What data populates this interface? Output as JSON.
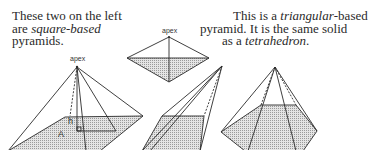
{
  "captions": {
    "left": {
      "line1": "These two on the left",
      "line2_prefix": "are ",
      "line2_italic": "square-based",
      "line3": "pyramids."
    },
    "right": {
      "line1_prefix": "This is a ",
      "line1_italic": "triangular",
      "line1_suffix": "-based",
      "line2": "pyramid. It is the same solid",
      "line3_prefix": "as a ",
      "line3_italic": "tetrahedron",
      "line3_suffix": "."
    }
  },
  "figures": {
    "large_square_pyramid": {
      "apex_label": "apex",
      "height_label": "h",
      "area_label": "A"
    },
    "tetrahedron": {
      "apex_label": "apex"
    },
    "oblique_square_pyramid": {},
    "hexagonal_pyramid": {}
  },
  "colors": {
    "line": "#2a2a2a",
    "base_fill": "#cfcfcf",
    "background": "#ffffff"
  }
}
